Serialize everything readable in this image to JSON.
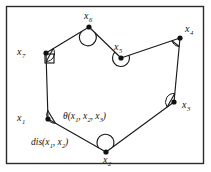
{
  "figure": {
    "frame": {
      "stroke_color": "#2b2b2b",
      "fill_color": "#ffffff",
      "x": 6,
      "y": 6,
      "width": 197,
      "height": 157
    },
    "line_color": "#1a1a1a",
    "vertex_color": "#111111",
    "vertices": [
      {
        "id": "x1",
        "name": "vertex-x1",
        "base": "x",
        "subscript": "1",
        "cx": 48,
        "cy": 119,
        "label_x": 17,
        "label_y": 113,
        "marker": "angle-wedge-right"
      },
      {
        "id": "x2",
        "name": "vertex-x2",
        "base": "x",
        "subscript": "2",
        "cx": 106,
        "cy": 152,
        "label_x": 103,
        "label_y": 155,
        "marker": "angle-arc-reflex"
      },
      {
        "id": "x3",
        "name": "vertex-x3",
        "base": "x",
        "subscript": "3",
        "cx": 174,
        "cy": 102,
        "label_x": 182,
        "label_y": 100,
        "marker": "angle-wedge-up"
      },
      {
        "id": "x4",
        "name": "vertex-x4",
        "base": "x",
        "subscript": "4",
        "cx": 180,
        "cy": 38,
        "label_x": 185,
        "label_y": 24,
        "marker": "angle-wedge-left"
      },
      {
        "id": "x5",
        "name": "vertex-x5",
        "base": "x",
        "subscript": "5",
        "cx": 121,
        "cy": 58,
        "label_x": 114,
        "label_y": 42,
        "marker": "angle-arc-reflex"
      },
      {
        "id": "x6",
        "name": "vertex-x6",
        "base": "x",
        "subscript": "6",
        "cx": 89,
        "cy": 27,
        "label_x": 84,
        "label_y": 11,
        "marker": "angle-arc-wide"
      },
      {
        "id": "x7",
        "name": "vertex-x7",
        "base": "x",
        "subscript": "7",
        "cx": 46,
        "cy": 53,
        "label_x": 17,
        "label_y": 47,
        "marker": "angle-wedge-right-square"
      }
    ],
    "edges": [
      {
        "from": "x1",
        "to": "x2",
        "name": "edge-x1-x2"
      },
      {
        "from": "x2",
        "to": "x3",
        "name": "edge-x2-x3"
      },
      {
        "from": "x3",
        "to": "x4",
        "name": "edge-x3-x4"
      },
      {
        "from": "x4",
        "to": "x5",
        "name": "edge-x4-x5"
      },
      {
        "from": "x5",
        "to": "x6",
        "name": "edge-x5-x6"
      },
      {
        "from": "x6",
        "to": "x7",
        "name": "edge-x6-x7"
      },
      {
        "from": "x7",
        "to": "x1",
        "name": "edge-x7-x1"
      }
    ],
    "annotations": [
      {
        "id": "theta",
        "name": "angle-annotation-theta",
        "symbol": "θ",
        "open": "(",
        "args": [
          {
            "base": "x",
            "subscript": "1"
          },
          {
            "base": "x",
            "subscript": "2"
          },
          {
            "base": "x",
            "subscript": "3"
          }
        ],
        "close": ")",
        "separator": ", ",
        "x": 63,
        "y": 112
      },
      {
        "id": "dis",
        "name": "distance-annotation-dis",
        "symbol": "dis",
        "open": "(",
        "args": [
          {
            "base": "x",
            "subscript": "1"
          },
          {
            "base": "x",
            "subscript": "2"
          }
        ],
        "close": ")",
        "separator": ", ",
        "x": 31,
        "y": 138
      }
    ]
  }
}
